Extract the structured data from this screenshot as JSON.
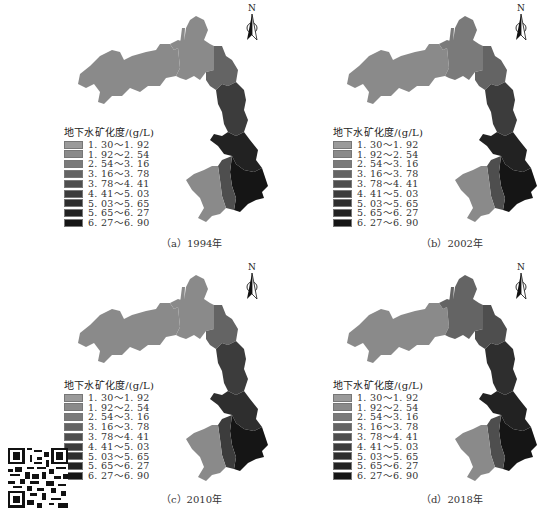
{
  "figure": {
    "legend_title": "地下水矿化度/(g/L)",
    "north_label": "N",
    "legend_classes": [
      {
        "label": "1. 30～1. 92",
        "color": "#9a9a9a"
      },
      {
        "label": "1. 92～2. 54",
        "color": "#8a8a8a"
      },
      {
        "label": "2. 54～3. 16",
        "color": "#7a7a7a"
      },
      {
        "label": "3. 16～3. 78",
        "color": "#646464"
      },
      {
        "label": "3. 78～4. 41",
        "color": "#4e4e4e"
      },
      {
        "label": "4. 41～5. 03",
        "color": "#3c3c3c"
      },
      {
        "label": "5. 03～5. 65",
        "color": "#2e2e2e"
      },
      {
        "label": "5. 65～6. 27",
        "color": "#222222"
      },
      {
        "label": "6. 27～6. 90",
        "color": "#151515"
      }
    ],
    "panels": [
      {
        "id": "a",
        "caption": "（a）1994年",
        "year": "1994",
        "zones": {
          "west": "#8a8a8a",
          "north": "#8a8a8a",
          "ne": "#646464",
          "east_upper": "#3c3c3c",
          "east_mid": "#222222",
          "south_core": "#151515",
          "sw_lobe": "#8a8a8a",
          "sw_mid": "#4e4e4e"
        }
      },
      {
        "id": "b",
        "caption": "（b）2002年",
        "year": "2002",
        "zones": {
          "west": "#8a8a8a",
          "north": "#7a7a7a",
          "ne": "#646464",
          "east_upper": "#3c3c3c",
          "east_mid": "#222222",
          "south_core": "#151515",
          "sw_lobe": "#8a8a8a",
          "sw_mid": "#4e4e4e"
        }
      },
      {
        "id": "c",
        "caption": "（c）2010年",
        "year": "2010",
        "zones": {
          "west": "#8a8a8a",
          "north": "#8a8a8a",
          "ne": "#646464",
          "east_upper": "#3c3c3c",
          "east_mid": "#2e2e2e",
          "south_core": "#151515",
          "sw_lobe": "#8a8a8a",
          "sw_mid": "#3c3c3c"
        }
      },
      {
        "id": "d",
        "caption": "（d）2018年",
        "year": "2018",
        "zones": {
          "west": "#8a8a8a",
          "north": "#646464",
          "ne": "#4e4e4e",
          "east_upper": "#2e2e2e",
          "east_mid": "#222222",
          "south_core": "#151515",
          "sw_lobe": "#8a8a8a",
          "sw_mid": "#4e4e4e"
        }
      }
    ]
  },
  "qr_code": {
    "present": true
  }
}
